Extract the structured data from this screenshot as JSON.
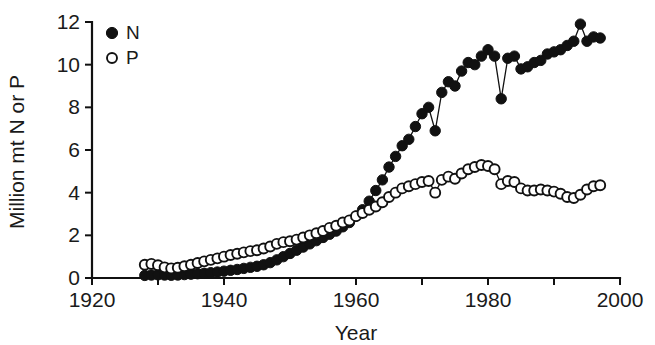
{
  "chart_data": {
    "type": "scatter",
    "title": "",
    "subtitle": "",
    "xlabel": "Year",
    "ylabel": "Million mt N or P",
    "xlim": [
      1920,
      2000
    ],
    "ylim": [
      0,
      12
    ],
    "xticks": [
      1920,
      1930,
      1940,
      1950,
      1960,
      1970,
      1980,
      1990,
      2000
    ],
    "xtick_labels": [
      "1920",
      "",
      "1940",
      "",
      "1960",
      "",
      "1980",
      "",
      "2000"
    ],
    "yticks": [
      0,
      2,
      4,
      6,
      8,
      10,
      12
    ],
    "ytick_labels": [
      "0",
      "2",
      "4",
      "6",
      "8",
      "10",
      "12"
    ],
    "grid": false,
    "legend_position": "top-left",
    "legend": [
      {
        "name": "N",
        "marker": "filled-circle",
        "color": "#111111"
      },
      {
        "name": "P",
        "marker": "open-circle",
        "color": "#111111"
      }
    ],
    "series": [
      {
        "name": "N",
        "marker": "filled-circle",
        "color": "#111111",
        "x": [
          1928,
          1929,
          1930,
          1931,
          1932,
          1933,
          1934,
          1935,
          1936,
          1937,
          1938,
          1939,
          1940,
          1941,
          1942,
          1943,
          1944,
          1945,
          1946,
          1947,
          1948,
          1949,
          1950,
          1951,
          1952,
          1953,
          1954,
          1955,
          1956,
          1957,
          1958,
          1959,
          1960,
          1961,
          1962,
          1963,
          1964,
          1965,
          1966,
          1967,
          1968,
          1969,
          1970,
          1971,
          1972,
          1973,
          1974,
          1975,
          1976,
          1977,
          1978,
          1979,
          1980,
          1981,
          1982,
          1983,
          1984,
          1985,
          1986,
          1987,
          1988,
          1989,
          1990,
          1991,
          1992,
          1993,
          1994,
          1995,
          1996,
          1997
        ],
        "y": [
          0.12,
          0.14,
          0.15,
          0.14,
          0.13,
          0.14,
          0.16,
          0.18,
          0.2,
          0.22,
          0.25,
          0.28,
          0.32,
          0.36,
          0.4,
          0.45,
          0.5,
          0.55,
          0.62,
          0.72,
          0.85,
          1.0,
          1.15,
          1.3,
          1.45,
          1.6,
          1.75,
          1.9,
          2.05,
          2.2,
          2.4,
          2.6,
          2.9,
          3.2,
          3.6,
          4.1,
          4.6,
          5.2,
          5.7,
          6.2,
          6.5,
          7.1,
          7.7,
          8.0,
          6.9,
          8.7,
          9.2,
          9.0,
          9.7,
          10.1,
          10.0,
          10.4,
          10.7,
          10.4,
          8.4,
          10.3,
          10.4,
          9.8,
          9.9,
          10.1,
          10.2,
          10.5,
          10.6,
          10.7,
          10.9,
          11.1,
          11.9,
          11.1,
          11.3,
          11.25
        ]
      },
      {
        "name": "P",
        "marker": "open-circle",
        "color": "#111111",
        "x": [
          1928,
          1929,
          1930,
          1931,
          1932,
          1933,
          1934,
          1935,
          1936,
          1937,
          1938,
          1939,
          1940,
          1941,
          1942,
          1943,
          1944,
          1945,
          1946,
          1947,
          1948,
          1949,
          1950,
          1951,
          1952,
          1953,
          1954,
          1955,
          1956,
          1957,
          1958,
          1959,
          1960,
          1961,
          1962,
          1963,
          1964,
          1965,
          1966,
          1967,
          1968,
          1969,
          1970,
          1971,
          1972,
          1973,
          1974,
          1975,
          1976,
          1977,
          1978,
          1979,
          1980,
          1981,
          1982,
          1983,
          1984,
          1985,
          1986,
          1987,
          1988,
          1989,
          1990,
          1991,
          1992,
          1993,
          1994,
          1995,
          1996,
          1997
        ],
        "y": [
          0.62,
          0.66,
          0.6,
          0.5,
          0.45,
          0.48,
          0.55,
          0.62,
          0.7,
          0.78,
          0.85,
          0.92,
          1.0,
          1.08,
          1.14,
          1.2,
          1.26,
          1.3,
          1.38,
          1.48,
          1.6,
          1.68,
          1.72,
          1.8,
          1.9,
          2.0,
          2.1,
          2.2,
          2.35,
          2.45,
          2.6,
          2.7,
          2.9,
          3.05,
          3.2,
          3.35,
          3.55,
          3.8,
          4.0,
          4.2,
          4.3,
          4.4,
          4.5,
          4.55,
          4.0,
          4.6,
          4.75,
          4.65,
          4.9,
          5.1,
          5.2,
          5.3,
          5.25,
          5.1,
          4.4,
          4.55,
          4.5,
          4.2,
          4.1,
          4.1,
          4.15,
          4.1,
          4.05,
          3.95,
          3.8,
          3.75,
          3.9,
          4.15,
          4.3,
          4.35
        ]
      }
    ]
  },
  "axes": {
    "x_title": "Year",
    "y_title": "Million mt N or P"
  }
}
